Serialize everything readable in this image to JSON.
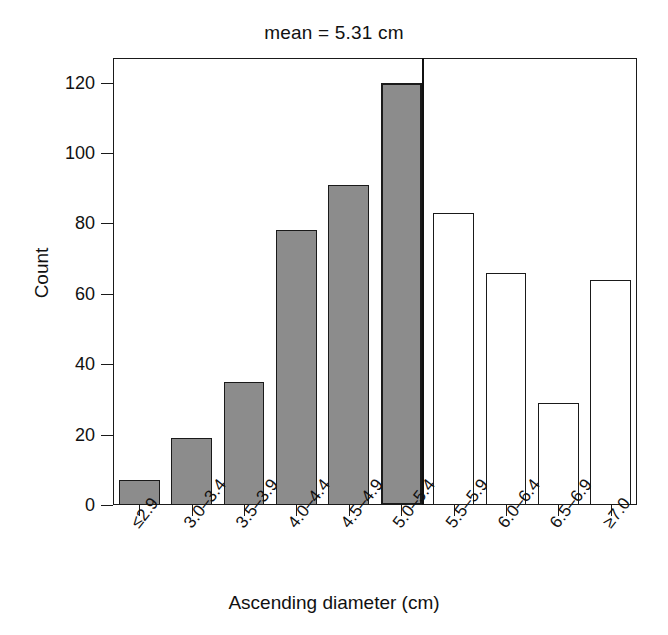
{
  "chart_data": {
    "type": "bar",
    "title": "mean = 5.31 cm",
    "xlabel": "Ascending diameter (cm)",
    "ylabel": "Count",
    "categories": [
      "≤2.9",
      "3.0–3.4",
      "3.5–3.9",
      "4.0–4.4",
      "4.5–4.9",
      "5.0–5.4",
      "5.5–5.9",
      "6.0–6.4",
      "6.5–6.9",
      "≥7.0"
    ],
    "values": [
      7,
      19,
      35,
      78,
      91,
      120,
      83,
      66,
      29,
      64
    ],
    "bar_styles": [
      "filled",
      "filled",
      "filled",
      "filled",
      "filled",
      "filled",
      "hollow",
      "hollow",
      "hollow",
      "hollow"
    ],
    "ylim": [
      0,
      127
    ],
    "yticks": [
      0,
      20,
      40,
      60,
      80,
      100,
      120
    ],
    "ytick_labels": [
      "0",
      "20",
      "40",
      "60",
      "80",
      "100",
      "120"
    ],
    "xlim_note": "categorical, 10 equal bins",
    "grid": false,
    "legend": null,
    "annotations": [
      {
        "name": "mean-line",
        "label": "mean = 5.31 cm",
        "value": 5.31,
        "units": "cm",
        "orientation": "vertical",
        "at_category": "5.0–5.4",
        "color": "#111111"
      }
    ],
    "colors": {
      "bar_fill": "#8c8c8c",
      "bar_edge": "#1a1a1a",
      "hollow_fill": "#ffffff",
      "axis": "#1a1a1a",
      "text": "#111111",
      "background": "#ffffff"
    }
  },
  "caption": {
    "fragment": ""
  }
}
